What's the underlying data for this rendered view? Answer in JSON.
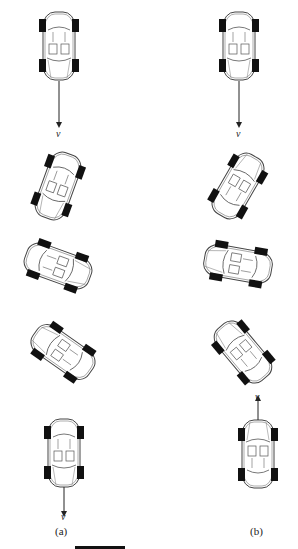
{
  "columns": [
    {
      "label": "(a)",
      "cars": [
        {
          "id": "a1",
          "heading": 180,
          "note": "drives down"
        },
        {
          "id": "a2",
          "heading": 160
        },
        {
          "id": "a3",
          "heading": 110
        },
        {
          "id": "a4",
          "heading": 30
        },
        {
          "id": "a5",
          "heading": 0
        }
      ],
      "velocity_labels": [
        "v",
        "v"
      ]
    },
    {
      "label": "(b)",
      "cars": [
        {
          "id": "b1",
          "heading": 0
        },
        {
          "id": "b2",
          "heading": 30
        },
        {
          "id": "b3",
          "heading": 80
        },
        {
          "id": "b4",
          "heading": 150
        },
        {
          "id": "b5",
          "heading": 0
        }
      ],
      "velocity_labels": [
        "v",
        "v"
      ]
    }
  ],
  "colors": {
    "tire": "#111111",
    "line": "#444444",
    "body": "#ffffff"
  }
}
